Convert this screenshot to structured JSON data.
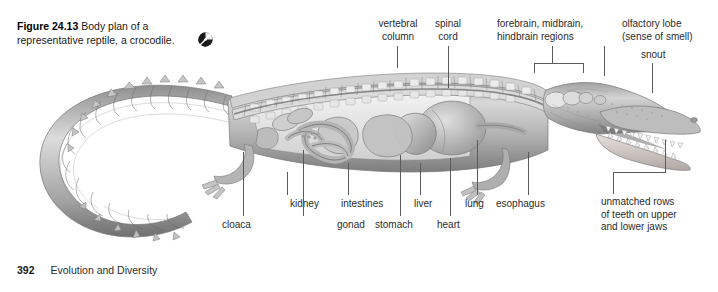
{
  "figure": {
    "number": "Figure 24.13",
    "caption": "Body plan of a representative reptile, a crocodile.",
    "media_icon": "multimedia-disc-icon"
  },
  "footer": {
    "page_number": "392",
    "book_section": "Evolution and Diversity"
  },
  "colors": {
    "background": "#ffffff",
    "text": "#2b2b2b",
    "heading": "#000000",
    "leader_line": "#5a5a5a",
    "illustration_light": "#e8e8e8",
    "illustration_mid": "#a8a8a8",
    "illustration_dark": "#6e6e6e",
    "illustration_shadow": "#4a4a4a"
  },
  "labels": {
    "top": [
      {
        "id": "vertebral-column",
        "text": "vertebral\ncolumn"
      },
      {
        "id": "spinal-cord",
        "text": "spinal\ncord"
      },
      {
        "id": "brain-regions",
        "text": "forebrain, midbrain,\nhindbrain regions"
      },
      {
        "id": "olfactory-lobe",
        "text": "olfactory lobe\n(sense of smell)"
      },
      {
        "id": "snout",
        "text": "snout"
      }
    ],
    "bottom": [
      {
        "id": "cloaca",
        "text": "cloaca"
      },
      {
        "id": "kidney",
        "text": "kidney"
      },
      {
        "id": "gonad",
        "text": "gonad"
      },
      {
        "id": "intestines",
        "text": "intestines"
      },
      {
        "id": "stomach",
        "text": "stomach"
      },
      {
        "id": "liver",
        "text": "liver"
      },
      {
        "id": "heart",
        "text": "heart"
      },
      {
        "id": "lung",
        "text": "lung"
      },
      {
        "id": "esophagus",
        "text": "esophagus"
      },
      {
        "id": "teeth",
        "text": "unmatched rows\nof teeth on upper\nand lower jaws"
      }
    ]
  }
}
